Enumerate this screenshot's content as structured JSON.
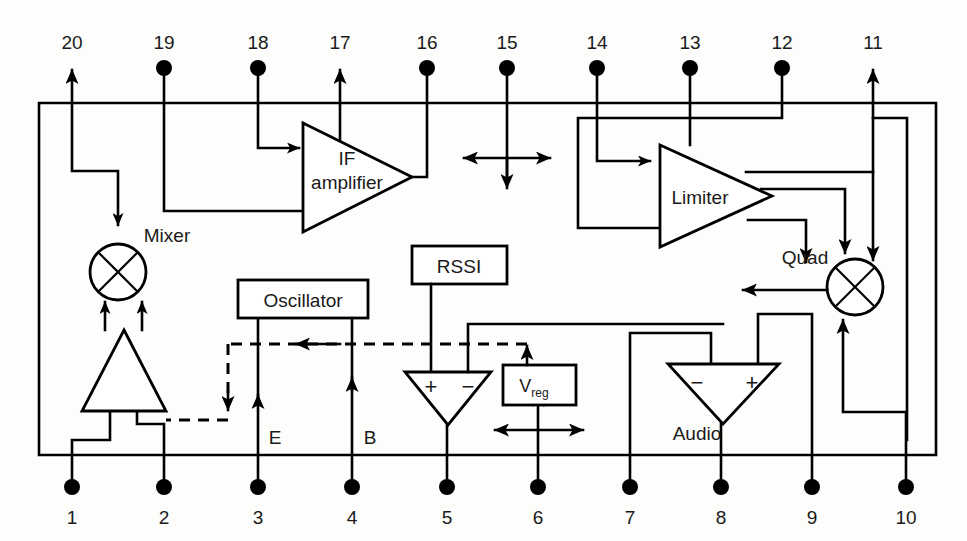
{
  "diagram": {
    "pins_top": [
      {
        "number": "20",
        "x": 72,
        "terminal": "arrow-up"
      },
      {
        "number": "19",
        "x": 164,
        "terminal": "dot"
      },
      {
        "number": "18",
        "x": 258,
        "terminal": "dot"
      },
      {
        "number": "17",
        "x": 340,
        "terminal": "arrow-up"
      },
      {
        "number": "16",
        "x": 427,
        "terminal": "dot"
      },
      {
        "number": "15",
        "x": 507,
        "terminal": "dot"
      },
      {
        "number": "14",
        "x": 597,
        "terminal": "dot"
      },
      {
        "number": "13",
        "x": 690,
        "terminal": "dot"
      },
      {
        "number": "12",
        "x": 782,
        "terminal": "dot"
      },
      {
        "number": "11",
        "x": 873,
        "terminal": "arrow-up"
      }
    ],
    "pins_bottom": [
      {
        "number": "1",
        "x": 72,
        "terminal": "dot"
      },
      {
        "number": "2",
        "x": 164,
        "terminal": "dot"
      },
      {
        "number": "3",
        "x": 258,
        "terminal": "dot"
      },
      {
        "number": "4",
        "x": 352,
        "terminal": "dot"
      },
      {
        "number": "5",
        "x": 447,
        "terminal": "dot"
      },
      {
        "number": "6",
        "x": 538,
        "terminal": "dot"
      },
      {
        "number": "7",
        "x": 630,
        "terminal": "dot"
      },
      {
        "number": "8",
        "x": 721,
        "terminal": "dot"
      },
      {
        "number": "9",
        "x": 812,
        "terminal": "dot"
      },
      {
        "number": "10",
        "x": 906,
        "terminal": "dot"
      }
    ],
    "blocks": [
      {
        "id": "mixer",
        "label": "Mixer",
        "kind": "mixer-circle"
      },
      {
        "id": "rf-amp",
        "label": "",
        "kind": "triangle-up"
      },
      {
        "id": "if-amp",
        "label": "IF amplifier",
        "kind": "triangle-right"
      },
      {
        "id": "limiter",
        "label": "Limiter",
        "kind": "triangle-right"
      },
      {
        "id": "oscillator",
        "label": "Oscillator",
        "kind": "box"
      },
      {
        "id": "rssi",
        "label": "RSSI",
        "kind": "box"
      },
      {
        "id": "vreg",
        "label": "V",
        "label_sub": "reg",
        "kind": "box"
      },
      {
        "id": "comparator",
        "label": "",
        "kind": "triangle-down",
        "in_plus": "+",
        "in_minus": "−"
      },
      {
        "id": "audio",
        "label": "Audio",
        "kind": "triangle-down",
        "in_minus": "−",
        "in_plus": "+"
      },
      {
        "id": "quad",
        "label": "Quad",
        "kind": "mixer-circle"
      }
    ],
    "labels": {
      "mixer": "Mixer",
      "if_amplifier_line1": "IF",
      "if_amplifier_line2": "amplifier",
      "limiter": "Limiter",
      "oscillator": "Oscillator",
      "rssi": "RSSI",
      "vreg_main": "V",
      "vreg_sub": "reg",
      "audio": "Audio",
      "quad": "Quad",
      "emitter": "E",
      "base": "B",
      "plus": "+",
      "minus": "−"
    },
    "colors": {
      "line": "#000000",
      "background": "#fdfdfb",
      "fill": "#ffffff",
      "text": "#1a1a1a"
    }
  }
}
